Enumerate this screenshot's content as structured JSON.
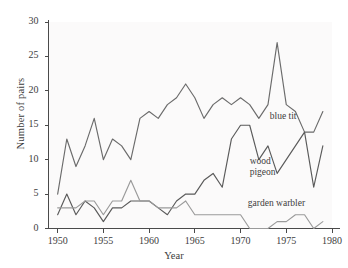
{
  "chart_data": {
    "type": "line",
    "title": "",
    "xlabel": "Year",
    "ylabel": "Number of pairs",
    "xlim": [
      1949,
      1980
    ],
    "ylim": [
      0,
      30
    ],
    "xticks": [
      1950,
      1955,
      1960,
      1965,
      1970,
      1975,
      1980
    ],
    "yticks": [
      0,
      5,
      10,
      15,
      20,
      25,
      30
    ],
    "grid": false,
    "legend_position": "inline-annotations",
    "x": [
      1950,
      1951,
      1952,
      1953,
      1954,
      1955,
      1956,
      1957,
      1958,
      1959,
      1960,
      1961,
      1962,
      1963,
      1964,
      1965,
      1966,
      1967,
      1968,
      1969,
      1970,
      1971,
      1972,
      1973,
      1974,
      1975,
      1976,
      1977,
      1978,
      1979
    ],
    "series": [
      {
        "name": "blue tit",
        "color": "#6b6b6b",
        "values": [
          5,
          13,
          9,
          12,
          16,
          10,
          13,
          12,
          10,
          16,
          17,
          16,
          18,
          19,
          21,
          19,
          16,
          18,
          19,
          18,
          19,
          18,
          16,
          18,
          27,
          18,
          17,
          14,
          14,
          17
        ]
      },
      {
        "name": "wood pigeon",
        "color": "#5a5a5a",
        "values": [
          2,
          5,
          2,
          4,
          3,
          1,
          3,
          3,
          4,
          4,
          4,
          3,
          2,
          4,
          5,
          5,
          7,
          8,
          6,
          13,
          15,
          15,
          10,
          12,
          8,
          10,
          12,
          14,
          6,
          12
        ]
      },
      {
        "name": "garden warbler",
        "color": "#9a9a9a",
        "values": [
          3,
          3,
          3,
          4,
          4,
          2,
          4,
          4,
          7,
          4,
          4,
          3,
          3,
          3,
          4,
          2,
          2,
          2,
          2,
          2,
          2,
          0,
          0,
          0,
          1,
          1,
          2,
          2,
          0,
          1
        ]
      }
    ],
    "annotations": [
      {
        "text": "blue tit",
        "x": 1973.2,
        "y": 16.2
      },
      {
        "text": "wood",
        "x": 1971.0,
        "y": 9.6
      },
      {
        "text": "pigeon",
        "x": 1971.0,
        "y": 8.0
      },
      {
        "text": "garden warbler",
        "x": 1970.8,
        "y": 3.6
      }
    ]
  },
  "axes": {
    "ylabel": "Number of pairs",
    "xlabel": "Year",
    "ytick_labels": [
      "0",
      "5",
      "10",
      "15",
      "20",
      "25",
      "30"
    ],
    "xtick_labels": [
      "1950",
      "1955",
      "1960",
      "1965",
      "1970",
      "1975",
      "1980"
    ]
  },
  "labels": {
    "blue_tit": "blue tit",
    "wood": "wood",
    "pigeon": "pigeon",
    "garden_warbler": "garden warbler"
  },
  "colors": {
    "axis": "#4a4a4a",
    "blue_tit": "#6b6b6b",
    "wood_pigeon": "#5a5a5a",
    "garden_warbler": "#9a9a9a",
    "background": "#ffffff",
    "plot_tint": "#fbfafa"
  }
}
